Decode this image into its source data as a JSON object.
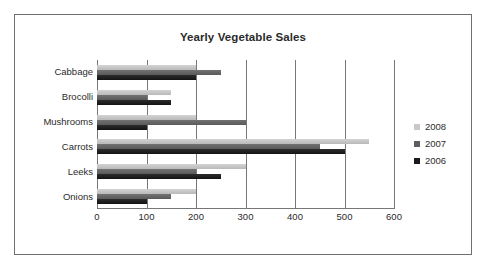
{
  "chart_data": {
    "type": "bar",
    "orientation": "horizontal",
    "title": "Yearly Vegetable Sales",
    "xlabel": "",
    "ylabel": "",
    "categories": [
      "Cabbage",
      "Brocolli",
      "Mushrooms",
      "Carrots",
      "Leeks",
      "Onions"
    ],
    "series": [
      {
        "name": "2008",
        "color": "#c9c9c9",
        "values": [
          200,
          150,
          200,
          550,
          300,
          200
        ]
      },
      {
        "name": "2007",
        "color": "#5e5e5e",
        "values": [
          250,
          100,
          300,
          450,
          200,
          150
        ]
      },
      {
        "name": "2006",
        "color": "#1a1a1a",
        "values": [
          200,
          150,
          100,
          500,
          250,
          100
        ]
      }
    ],
    "xlim": [
      0,
      600
    ],
    "xticks": [
      0,
      100,
      200,
      300,
      400,
      500,
      600
    ],
    "xtick_labels": [
      "0",
      "100",
      "200",
      "300",
      "400",
      "500",
      "600"
    ],
    "grid": "vertical",
    "legend_position": "right",
    "legend_entries": [
      "2008",
      "2007",
      "2006"
    ]
  },
  "frame": {
    "border_color": "#6f6f6f",
    "background": "#ffffff"
  }
}
